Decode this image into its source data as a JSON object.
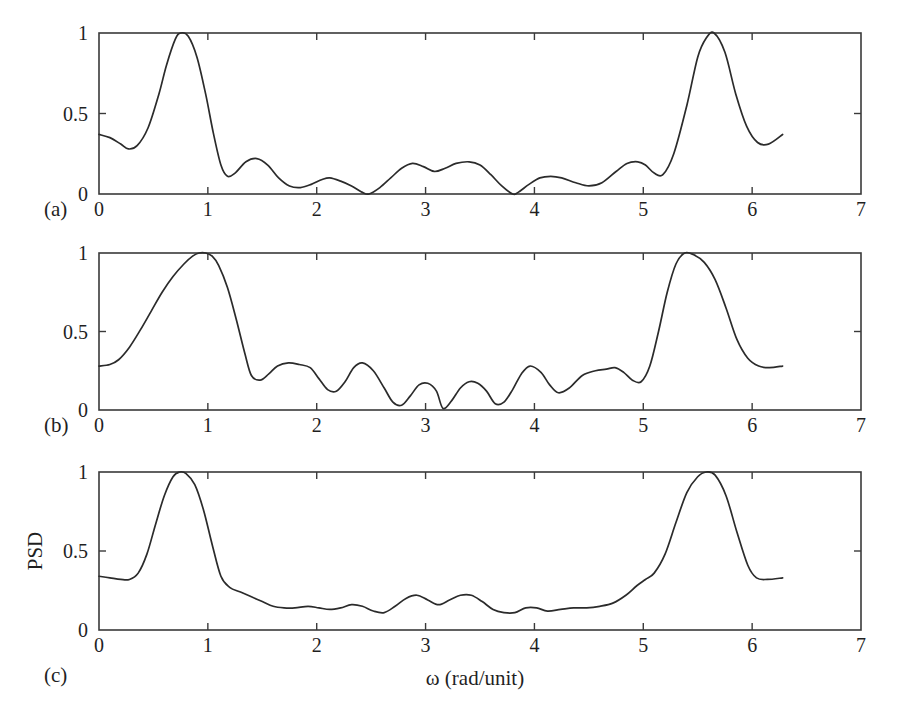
{
  "figure": {
    "background_color": "#ffffff",
    "line_color": "#2b2b2b",
    "axis_color": "#3a3a3a",
    "xlabel": "ω (rad/unit)",
    "ylabel": "PSD",
    "panel_labels": [
      "(a)",
      "(b)",
      "(c)"
    ],
    "x_tick_labels": [
      "0",
      "1",
      "2",
      "3",
      "4",
      "5",
      "6",
      "7"
    ],
    "y_tick_labels": [
      "0",
      "0.5",
      "1"
    ]
  },
  "chart_data": [
    {
      "type": "line",
      "panel": "(a)",
      "title": "",
      "xlabel": "",
      "ylabel": "PSD",
      "xlim": [
        0,
        7
      ],
      "ylim": [
        0,
        1
      ],
      "xticks": [
        0,
        1,
        2,
        3,
        4,
        5,
        6,
        7
      ],
      "yticks": [
        0,
        0.5,
        1
      ],
      "grid": false,
      "legend": null,
      "x": [
        0.0,
        0.1,
        0.2,
        0.27,
        0.35,
        0.45,
        0.55,
        0.62,
        0.7,
        0.75,
        0.82,
        0.9,
        0.98,
        1.05,
        1.12,
        1.18,
        1.25,
        1.35,
        1.45,
        1.55,
        1.65,
        1.75,
        1.85,
        1.95,
        2.05,
        2.12,
        2.22,
        2.32,
        2.42,
        2.48,
        2.58,
        2.68,
        2.78,
        2.88,
        2.98,
        3.08,
        3.18,
        3.28,
        3.4,
        3.5,
        3.6,
        3.7,
        3.8,
        3.85,
        3.95,
        4.05,
        4.15,
        4.25,
        4.38,
        4.5,
        4.62,
        4.75,
        4.85,
        4.95,
        5.02,
        5.1,
        5.18,
        5.28,
        5.4,
        5.5,
        5.58,
        5.65,
        5.75,
        5.85,
        5.95,
        6.05,
        6.15,
        6.28
      ],
      "y": [
        0.37,
        0.35,
        0.31,
        0.28,
        0.3,
        0.41,
        0.62,
        0.8,
        0.96,
        1.0,
        0.98,
        0.85,
        0.62,
        0.38,
        0.18,
        0.11,
        0.13,
        0.2,
        0.22,
        0.18,
        0.1,
        0.05,
        0.04,
        0.06,
        0.09,
        0.1,
        0.08,
        0.05,
        0.01,
        0.0,
        0.04,
        0.1,
        0.16,
        0.19,
        0.17,
        0.14,
        0.16,
        0.19,
        0.2,
        0.18,
        0.12,
        0.05,
        0.0,
        0.01,
        0.06,
        0.1,
        0.11,
        0.1,
        0.07,
        0.05,
        0.07,
        0.14,
        0.19,
        0.2,
        0.18,
        0.13,
        0.12,
        0.25,
        0.55,
        0.85,
        0.97,
        1.0,
        0.88,
        0.62,
        0.42,
        0.32,
        0.31,
        0.37
      ]
    },
    {
      "type": "line",
      "panel": "(b)",
      "title": "",
      "xlabel": "",
      "ylabel": "PSD",
      "xlim": [
        0,
        7
      ],
      "ylim": [
        0,
        1
      ],
      "xticks": [
        0,
        1,
        2,
        3,
        4,
        5,
        6,
        7
      ],
      "yticks": [
        0,
        0.5,
        1
      ],
      "grid": false,
      "legend": null,
      "x": [
        0.0,
        0.1,
        0.18,
        0.28,
        0.38,
        0.48,
        0.58,
        0.68,
        0.78,
        0.86,
        0.92,
        0.98,
        1.04,
        1.1,
        1.18,
        1.26,
        1.34,
        1.4,
        1.48,
        1.56,
        1.64,
        1.74,
        1.84,
        1.94,
        2.02,
        2.1,
        2.18,
        2.26,
        2.34,
        2.42,
        2.52,
        2.62,
        2.7,
        2.78,
        2.86,
        2.94,
        3.02,
        3.1,
        3.16,
        3.24,
        3.32,
        3.4,
        3.48,
        3.56,
        3.64,
        3.72,
        3.8,
        3.88,
        3.96,
        4.06,
        4.14,
        4.22,
        4.32,
        4.44,
        4.56,
        4.66,
        4.74,
        4.82,
        4.9,
        4.98,
        5.06,
        5.14,
        5.22,
        5.3,
        5.38,
        5.46,
        5.56,
        5.66,
        5.76,
        5.86,
        5.96,
        6.06,
        6.16,
        6.28
      ],
      "y": [
        0.28,
        0.29,
        0.32,
        0.4,
        0.51,
        0.63,
        0.75,
        0.85,
        0.93,
        0.98,
        1.0,
        1.0,
        0.98,
        0.92,
        0.78,
        0.58,
        0.36,
        0.22,
        0.19,
        0.23,
        0.28,
        0.3,
        0.29,
        0.27,
        0.2,
        0.13,
        0.12,
        0.18,
        0.27,
        0.3,
        0.25,
        0.14,
        0.05,
        0.03,
        0.09,
        0.16,
        0.17,
        0.12,
        0.01,
        0.06,
        0.14,
        0.18,
        0.17,
        0.12,
        0.04,
        0.05,
        0.13,
        0.23,
        0.28,
        0.24,
        0.16,
        0.11,
        0.14,
        0.22,
        0.25,
        0.26,
        0.27,
        0.24,
        0.19,
        0.18,
        0.28,
        0.5,
        0.75,
        0.93,
        1.0,
        0.99,
        0.94,
        0.83,
        0.65,
        0.45,
        0.33,
        0.28,
        0.27,
        0.28
      ]
    },
    {
      "type": "line",
      "panel": "(c)",
      "title": "",
      "xlabel": "ω (rad/unit)",
      "ylabel": "PSD",
      "xlim": [
        0,
        7
      ],
      "ylim": [
        0,
        1
      ],
      "xticks": [
        0,
        1,
        2,
        3,
        4,
        5,
        6,
        7
      ],
      "yticks": [
        0,
        0.5,
        1
      ],
      "grid": false,
      "legend": null,
      "x": [
        0.0,
        0.1,
        0.2,
        0.28,
        0.36,
        0.44,
        0.52,
        0.6,
        0.68,
        0.74,
        0.8,
        0.88,
        0.96,
        1.04,
        1.12,
        1.2,
        1.3,
        1.4,
        1.5,
        1.6,
        1.7,
        1.8,
        1.92,
        2.02,
        2.12,
        2.22,
        2.32,
        2.42,
        2.52,
        2.62,
        2.72,
        2.82,
        2.92,
        3.02,
        3.12,
        3.22,
        3.32,
        3.42,
        3.52,
        3.62,
        3.72,
        3.82,
        3.92,
        4.02,
        4.12,
        4.24,
        4.36,
        4.48,
        4.6,
        4.72,
        4.84,
        4.94,
        5.02,
        5.1,
        5.2,
        5.3,
        5.4,
        5.5,
        5.58,
        5.66,
        5.76,
        5.86,
        5.96,
        6.04,
        6.14,
        6.28
      ],
      "y": [
        0.34,
        0.33,
        0.32,
        0.32,
        0.36,
        0.48,
        0.67,
        0.85,
        0.97,
        1.0,
        0.99,
        0.92,
        0.76,
        0.54,
        0.34,
        0.27,
        0.24,
        0.21,
        0.18,
        0.15,
        0.14,
        0.14,
        0.15,
        0.14,
        0.13,
        0.14,
        0.16,
        0.15,
        0.12,
        0.11,
        0.15,
        0.2,
        0.22,
        0.19,
        0.16,
        0.19,
        0.22,
        0.22,
        0.18,
        0.13,
        0.11,
        0.11,
        0.14,
        0.14,
        0.12,
        0.13,
        0.14,
        0.14,
        0.15,
        0.17,
        0.22,
        0.28,
        0.32,
        0.36,
        0.48,
        0.68,
        0.87,
        0.97,
        1.0,
        0.98,
        0.85,
        0.62,
        0.41,
        0.33,
        0.32,
        0.33
      ]
    }
  ]
}
